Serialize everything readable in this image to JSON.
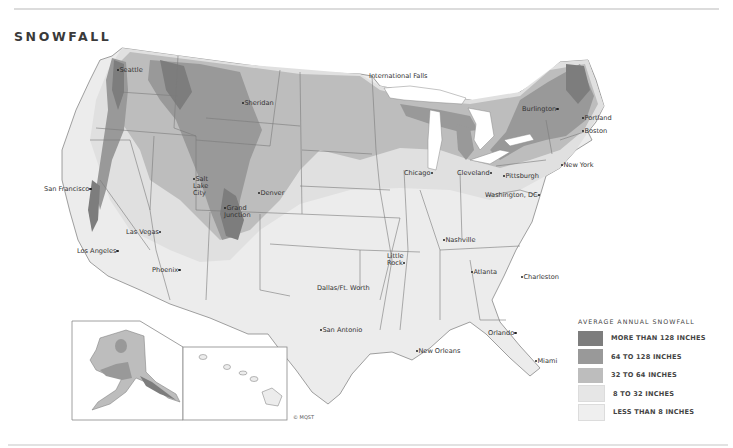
{
  "title": "SNOWFALL",
  "legend": {
    "title": "AVERAGE ANNUAL SNOWFALL",
    "items": [
      {
        "label": "MORE THAN 128 INCHES",
        "color": "#7d7d7d"
      },
      {
        "label": "64 TO 128 INCHES",
        "color": "#999999"
      },
      {
        "label": "32 TO 64 INCHES",
        "color": "#bdbdbd"
      },
      {
        "label": "8 TO 32 INCHES",
        "color": "#e0e0e0"
      },
      {
        "label": "LESS THAN 8 INCHES",
        "color": "#ececec"
      }
    ]
  },
  "cities": [
    {
      "name": "Seattle",
      "x": 118,
      "y": 70
    },
    {
      "name": "International Falls",
      "x": 371,
      "y": 77
    },
    {
      "name": "Sheridan",
      "x": 244,
      "y": 103
    },
    {
      "name": "Burlington",
      "x": 523,
      "y": 109
    },
    {
      "name": "Portland",
      "x": 583,
      "y": 117
    },
    {
      "name": "Boston",
      "x": 583,
      "y": 130
    },
    {
      "name": "Salt Lake City",
      "x": 193,
      "y": 178
    },
    {
      "name": "Denver",
      "x": 259,
      "y": 192
    },
    {
      "name": "San Francisco",
      "x": 44,
      "y": 189
    },
    {
      "name": "Grand Junction",
      "x": 225,
      "y": 207
    },
    {
      "name": "Chicago",
      "x": 404,
      "y": 173
    },
    {
      "name": "Cleveland",
      "x": 457,
      "y": 173
    },
    {
      "name": "Pittsburgh",
      "x": 505,
      "y": 176
    },
    {
      "name": "New York",
      "x": 563,
      "y": 165
    },
    {
      "name": "Washington, DC",
      "x": 486,
      "y": 195
    },
    {
      "name": "Las Vegas",
      "x": 127,
      "y": 232
    },
    {
      "name": "Los Angeles",
      "x": 77,
      "y": 251
    },
    {
      "name": "Phoenix",
      "x": 152,
      "y": 270
    },
    {
      "name": "Nashville",
      "x": 444,
      "y": 240
    },
    {
      "name": "Little Rock",
      "x": 387,
      "y": 259
    },
    {
      "name": "Atlanta",
      "x": 472,
      "y": 272
    },
    {
      "name": "Charleston",
      "x": 524,
      "y": 277
    },
    {
      "name": "Dallas/Ft. Worth",
      "x": 318,
      "y": 288
    },
    {
      "name": "San Antonio",
      "x": 322,
      "y": 329
    },
    {
      "name": "New Orleans",
      "x": 424,
      "y": 351
    },
    {
      "name": "Orlando",
      "x": 488,
      "y": 333
    },
    {
      "name": "Miami",
      "x": 537,
      "y": 361
    }
  ],
  "copyright": "© MQST"
}
